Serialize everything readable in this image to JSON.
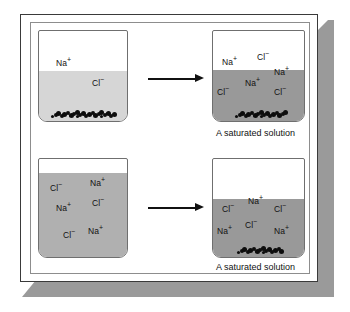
{
  "figure": {
    "background_color": "#ffffff",
    "frame_border_color": "#3a3a3a",
    "shadow_color": "#9a9a9a"
  },
  "panels": [
    {
      "id": "top-left",
      "name": "unsaturated-solution-beaker",
      "liquid_color": "#d6d6d6",
      "liquid_level": "partial",
      "has_precipitate": true,
      "caption": "",
      "ions": [
        {
          "label": "Na",
          "charge": "+",
          "x": 18,
          "y": 28
        },
        {
          "label": "Cl",
          "charge": "−",
          "x": 54,
          "y": 48
        }
      ]
    },
    {
      "id": "top-right",
      "name": "saturated-solution-beaker",
      "liquid_color": "#999999",
      "liquid_level": "partial",
      "has_precipitate": true,
      "caption": "A saturated solution",
      "ions": [
        {
          "label": "Na",
          "charge": "+",
          "x": 10,
          "y": 27
        },
        {
          "label": "Cl",
          "charge": "−",
          "x": 45,
          "y": 22
        },
        {
          "label": "Na",
          "charge": "+",
          "x": 62,
          "y": 37
        },
        {
          "label": "Na",
          "charge": "+",
          "x": 33,
          "y": 48
        },
        {
          "label": "Cl",
          "charge": "−",
          "x": 5,
          "y": 57
        },
        {
          "label": "Cl",
          "charge": "−",
          "x": 62,
          "y": 57
        }
      ]
    },
    {
      "id": "bottom-left",
      "name": "concentrated-solution-beaker",
      "liquid_color": "#b0b0b0",
      "liquid_level": "full",
      "has_precipitate": false,
      "caption": "",
      "ions": [
        {
          "label": "Cl",
          "charge": "−",
          "x": 12,
          "y": 25
        },
        {
          "label": "Na",
          "charge": "+",
          "x": 52,
          "y": 20
        },
        {
          "label": "Na",
          "charge": "+",
          "x": 18,
          "y": 45
        },
        {
          "label": "Cl",
          "charge": "−",
          "x": 54,
          "y": 40
        },
        {
          "label": "Cl",
          "charge": "−",
          "x": 25,
          "y": 72
        },
        {
          "label": "Na",
          "charge": "+",
          "x": 50,
          "y": 68
        }
      ]
    },
    {
      "id": "bottom-right",
      "name": "saturated-solution-beaker-with-solid",
      "liquid_color": "#999999",
      "liquid_level": "partial",
      "has_precipitate": true,
      "caption": "A saturated solution",
      "ions": [
        {
          "label": "Cl",
          "charge": "−",
          "x": 10,
          "y": 46
        },
        {
          "label": "Na",
          "charge": "+",
          "x": 36,
          "y": 38
        },
        {
          "label": "Cl",
          "charge": "−",
          "x": 62,
          "y": 46
        },
        {
          "label": "Na",
          "charge": "+",
          "x": 5,
          "y": 68
        },
        {
          "label": "Cl",
          "charge": "−",
          "x": 33,
          "y": 62
        },
        {
          "label": "Na",
          "charge": "+",
          "x": 62,
          "y": 68
        }
      ]
    }
  ],
  "arrows": [
    {
      "id": "top-arrow",
      "name": "reaction-arrow-top"
    },
    {
      "id": "bottom-arrow",
      "name": "reaction-arrow-bottom"
    }
  ]
}
